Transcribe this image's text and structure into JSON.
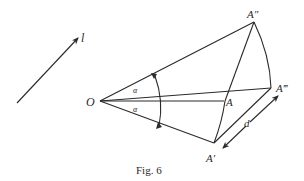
{
  "figure": {
    "caption": "Fig. 6",
    "labels": {
      "direction": "l",
      "origin": "O",
      "point_A": "A",
      "point_A_prime": "A′",
      "point_A_double_prime": "A″",
      "point_A_triple_prime": "A‴",
      "distance": "d",
      "angle_upper": "α",
      "angle_lower": "α"
    },
    "colors": {
      "ink": "#2a2a2a",
      "background": "#ffffff"
    }
  }
}
